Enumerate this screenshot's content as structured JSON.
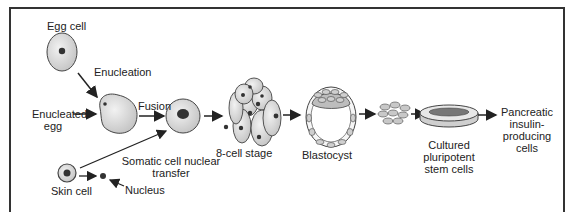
{
  "diagram": {
    "labels": {
      "egg_cell": "Egg cell",
      "enucleation": "Enucleation",
      "enucleated_egg_line1": "Enucleated",
      "enucleated_egg_line2": "egg",
      "fusion": "Fusion",
      "scnt_line1": "Somatic cell nuclear",
      "scnt_line2": "transfer",
      "skin_cell": "Skin cell",
      "nucleus": "Nucleus",
      "eight_cell": "8-cell stage",
      "blastocyst": "Blastocyst",
      "cultured_line1": "Cultured",
      "cultured_line2": "pluripotent",
      "cultured_line3": "stem cells",
      "pancreatic_line1": "Pancreatic",
      "pancreatic_line2": "insulin-",
      "pancreatic_line3": "producing",
      "pancreatic_line4": "cells"
    },
    "colors": {
      "cell_fill": "#d9d9d9",
      "cell_stroke": "#444444",
      "nucleus": "#333333",
      "arrow": "#222222",
      "frame": "#333333"
    }
  }
}
